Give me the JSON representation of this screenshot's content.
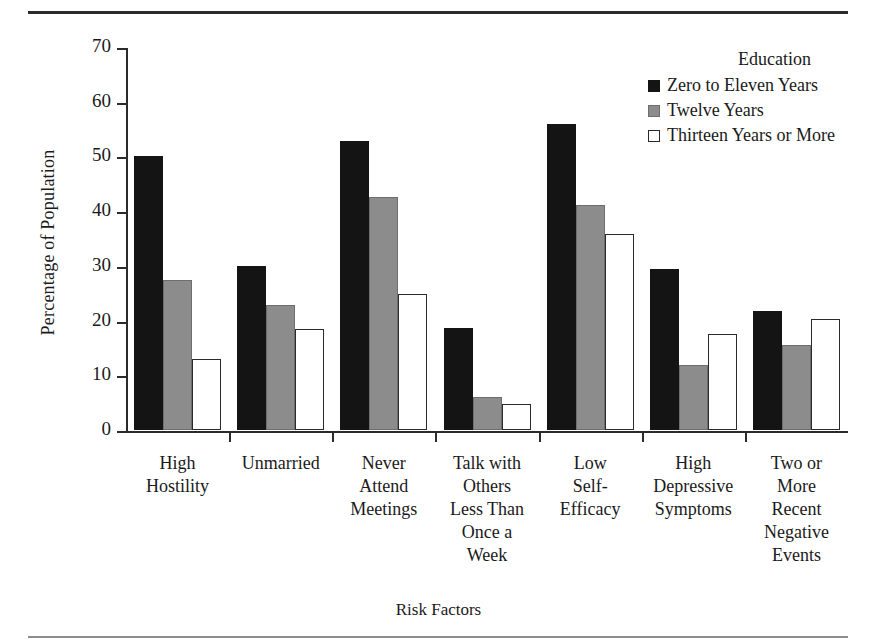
{
  "chart_data": {
    "type": "bar",
    "title": "",
    "xlabel": "Risk Factors",
    "ylabel": "Percentage of Population",
    "ylim": [
      0,
      70
    ],
    "yticks": [
      0,
      10,
      20,
      30,
      40,
      50,
      60,
      70
    ],
    "grid": false,
    "legend_position": "top-right",
    "legend_title": "Education",
    "categories": [
      "High\nHostility",
      "Unmarried",
      "Never\nAttend\nMeetings",
      "Talk with\nOthers\nLess Than\nOnce a\nWeek",
      "Low\nSelf-\nEfficacy",
      "High\nDepressive\nSymptoms",
      "Two or\nMore\nRecent\nNegative\nEvents"
    ],
    "series": [
      {
        "name": "Zero to Eleven Years",
        "color": "#141414",
        "values": [
          50.1,
          30.0,
          52.8,
          18.7,
          55.9,
          29.4,
          21.7
        ]
      },
      {
        "name": "Twelve Years",
        "color": "#8c8c8c",
        "values": [
          27.5,
          22.9,
          42.5,
          6.0,
          41.2,
          11.9,
          15.5
        ]
      },
      {
        "name": "Thirteen Years or More",
        "color": "#ffffff",
        "values": [
          12.9,
          18.5,
          24.9,
          4.8,
          35.8,
          17.5,
          20.3
        ]
      }
    ]
  },
  "legend": {
    "title": "Education",
    "items": [
      {
        "label": "Zero to Eleven Years"
      },
      {
        "label": "Twelve Years"
      },
      {
        "label": "Thirteen Years or More"
      }
    ]
  },
  "axes": {
    "y_title": "Percentage of Population",
    "x_title": "Risk Factors"
  }
}
